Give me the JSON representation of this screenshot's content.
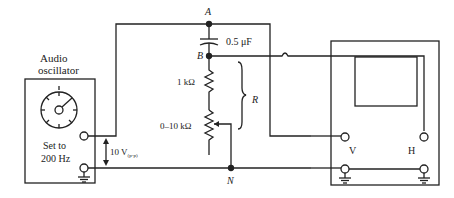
{
  "oscillator": {
    "title_line1": "Audio",
    "title_line2": "oscillator",
    "setting_line1": "Set to",
    "setting_line2": "200 Hz"
  },
  "source_voltage": {
    "value": "10 V",
    "subscript": "(p-p)"
  },
  "nodes": {
    "a": "A",
    "b": "B",
    "n": "N"
  },
  "components": {
    "capacitor": "0.5 μF",
    "resistor_fixed": "1 kΩ",
    "resistor_variable": "0–10 kΩ",
    "brace_label": "R"
  },
  "oscilloscope": {
    "input_v": "V",
    "input_h": "H"
  },
  "colors": {
    "line": "#222222",
    "background": "#ffffff"
  }
}
